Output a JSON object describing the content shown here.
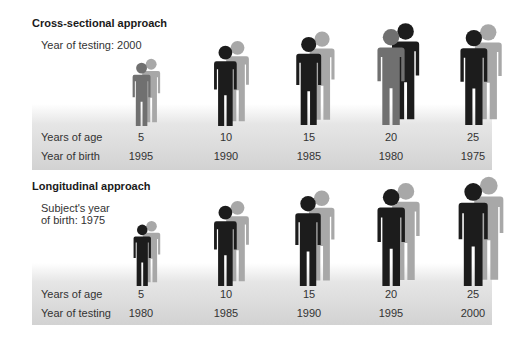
{
  "colors": {
    "dark": "#1c1c1c",
    "mid": "#707070",
    "light": "#a8a8a8",
    "band_top": "#ffffff",
    "band_bottom": "#d2d2d2"
  },
  "cross_sectional": {
    "title": "Cross-sectional approach",
    "subtitle": "Year of testing: 2000",
    "row1_label": "Years of age",
    "row2_label": "Year of birth",
    "columns": [
      {
        "age": "5",
        "year": "1995"
      },
      {
        "age": "10",
        "year": "1990"
      },
      {
        "age": "15",
        "year": "1985"
      },
      {
        "age": "20",
        "year": "1980"
      },
      {
        "age": "25",
        "year": "1975"
      }
    ]
  },
  "longitudinal": {
    "title": "Longitudinal approach",
    "subtitle": "Subject's year\nof birth: 1975",
    "row1_label": "Years of age",
    "row2_label": "Year of testing",
    "columns": [
      {
        "age": "5",
        "year": "1980"
      },
      {
        "age": "10",
        "year": "1985"
      },
      {
        "age": "15",
        "year": "1990"
      },
      {
        "age": "20",
        "year": "1995"
      },
      {
        "age": "25",
        "year": "2000"
      }
    ]
  },
  "figures": {
    "cross_sectional": [
      {
        "x": 141,
        "top": 62,
        "h": 64,
        "front": "mid",
        "back": "light"
      },
      {
        "x": 225,
        "top": 45,
        "h": 81,
        "front": "dark",
        "back": "light"
      },
      {
        "x": 308,
        "top": 36,
        "h": 89,
        "front": "dark",
        "back": "light"
      },
      {
        "x": 391,
        "top": 28,
        "h": 97,
        "front": "mid",
        "back": "dark"
      },
      {
        "x": 473,
        "top": 29,
        "h": 96,
        "front": "dark",
        "back": "light"
      }
    ],
    "longitudinal": [
      {
        "x": 142,
        "top": 224,
        "h": 62,
        "front": "dark",
        "back": "light"
      },
      {
        "x": 225,
        "top": 205,
        "h": 81,
        "front": "dark",
        "back": "light"
      },
      {
        "x": 308,
        "top": 195,
        "h": 91,
        "front": "dark",
        "back": "light"
      },
      {
        "x": 391,
        "top": 188,
        "h": 98,
        "front": "dark",
        "back": "light"
      },
      {
        "x": 473,
        "top": 182,
        "h": 104,
        "front": "dark",
        "back": "light"
      }
    ]
  }
}
